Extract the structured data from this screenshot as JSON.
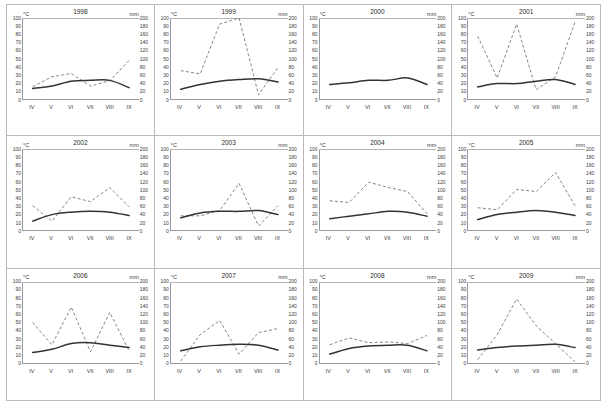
{
  "figure": {
    "name": "climate-diagrams-1998-2009",
    "columns": 4,
    "rows": 3,
    "unit_left": "°C",
    "unit_right": "mm",
    "months": [
      "IV",
      "V",
      "VI",
      "VII",
      "VIII",
      "IX"
    ],
    "temp_ticks": [
      "100",
      "90",
      "80",
      "70",
      "60",
      "50",
      "40",
      "30",
      "20",
      "10",
      "0"
    ],
    "precip_ticks": [
      "200",
      "180",
      "160",
      "140",
      "120",
      "100",
      "80",
      "60",
      "40",
      "20",
      "0"
    ],
    "colors": {
      "temperature_line": "#333333",
      "precipitation_line": "#6f6f6f",
      "axis": "#9a9a9a",
      "panel_border": "#b9b9b9",
      "text": "#2b2b2b"
    }
  },
  "chart_data": {
    "type": "line",
    "xlabel": "",
    "ylabel": "°C",
    "y2label": "mm",
    "x": [
      "IV",
      "V",
      "VI",
      "VII",
      "VIII",
      "IX"
    ],
    "ylim": [
      0,
      100
    ],
    "y2lim": [
      0,
      200
    ],
    "grid": false,
    "legend": "none",
    "series_names": [
      "Temperature (°C)",
      "Precipitation (mm)"
    ],
    "panels": [
      {
        "title": "1998",
        "temperature": [
          13,
          16,
          22,
          23,
          23,
          14
        ],
        "precipitation": [
          30,
          55,
          63,
          32,
          45,
          95
        ]
      },
      {
        "title": "1999",
        "temperature": [
          12,
          18,
          22,
          24,
          25,
          21
        ],
        "precipitation": [
          70,
          62,
          185,
          200,
          10,
          78
        ]
      },
      {
        "title": "2000",
        "temperature": [
          18,
          20,
          23,
          23,
          26,
          18
        ]
      },
      {
        "title": "2001",
        "temperature": [
          15,
          19,
          19,
          22,
          24,
          18
        ],
        "precipitation": [
          155,
          52,
          185,
          23,
          55,
          190
        ]
      },
      {
        "title": "2002",
        "temperature": [
          11,
          19,
          22,
          23,
          22,
          18
        ],
        "precipitation": [
          60,
          22,
          82,
          70,
          105,
          57
        ]
      },
      {
        "title": "2003",
        "temperature": [
          15,
          21,
          23,
          23,
          24,
          19
        ],
        "precipitation": [
          35,
          35,
          48,
          115,
          10,
          60
        ]
      },
      {
        "title": "2004",
        "temperature": [
          14,
          17,
          20,
          23,
          22,
          17
        ],
        "precipitation": [
          72,
          68,
          118,
          105,
          95,
          40
        ]
      },
      {
        "title": "2005",
        "temperature": [
          13,
          19,
          22,
          24,
          22,
          18
        ],
        "precipitation": [
          55,
          50,
          100,
          95,
          142,
          60
        ]
      },
      {
        "title": "2006",
        "temperature": [
          13,
          17,
          24,
          25,
          22,
          19
        ],
        "precipitation": [
          100,
          45,
          138,
          28,
          125,
          30
        ]
      },
      {
        "title": "2007",
        "temperature": [
          15,
          20,
          22,
          23,
          22,
          16
        ],
        "precipitation": [
          5,
          70,
          105,
          22,
          75,
          85
        ]
      },
      {
        "title": "2008",
        "temperature": [
          11,
          18,
          21,
          22,
          22,
          15
        ],
        "precipitation": [
          45,
          62,
          50,
          52,
          48,
          68
        ]
      },
      {
        "title": "2009",
        "temperature": [
          16,
          19,
          21,
          22,
          23,
          19
        ],
        "precipitation": [
          8,
          70,
          158,
          92,
          48,
          3
        ]
      }
    ]
  }
}
